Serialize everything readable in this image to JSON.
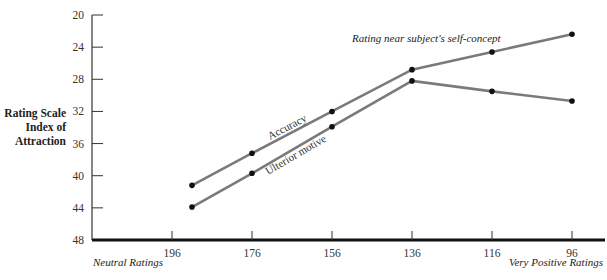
{
  "chart_data": {
    "type": "line",
    "title": "",
    "ylabel": "Rating Scale Index of Attraction",
    "ylabel_lines": [
      "Rating Scale",
      "Index of",
      "Attraction"
    ],
    "xlabel_left": "Neutral Ratings",
    "xlabel_right": "Very Positive Ratings",
    "annotation": "Rating near subject's self-concept",
    "y_ticks": [
      20,
      24,
      28,
      32,
      36,
      40,
      44,
      48
    ],
    "ylim": [
      48,
      20
    ],
    "y_inverted": true,
    "x_ticks": [
      196,
      176,
      156,
      136,
      116,
      96
    ],
    "x_points": [
      191,
      176,
      156,
      136,
      116,
      96
    ],
    "grid": false,
    "series": [
      {
        "name": "Accuracy",
        "values": [
          41.2,
          37.2,
          32.0,
          26.8,
          24.6,
          22.4
        ]
      },
      {
        "name": "Ulterior motive",
        "values": [
          43.9,
          39.7,
          33.9,
          28.2,
          29.5,
          30.7
        ]
      }
    ]
  }
}
